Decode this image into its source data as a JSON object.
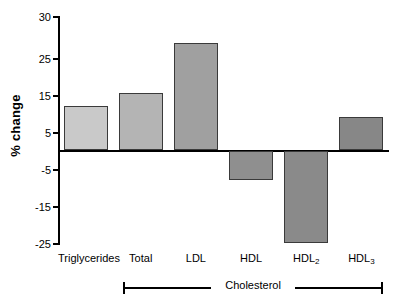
{
  "chart_data": {
    "type": "bar",
    "title": "",
    "xlabel": "",
    "ylabel": "% change",
    "categories": [
      "Triglycerides",
      "Total",
      "LDL",
      "HDL",
      "HDL₂",
      "HDL₃"
    ],
    "category_labels_html": [
      "Triglycerides",
      "Total",
      "LDL",
      "HDL",
      "HDL<sub>2</sub>",
      "HDL<sub>3</sub>"
    ],
    "values": [
      12,
      15.5,
      29,
      -8,
      -25,
      9
    ],
    "ylim": [
      -25,
      30
    ],
    "yticks": [
      30,
      25,
      15,
      5,
      -5,
      -15,
      -25
    ],
    "ytick_labels": [
      "30",
      "25",
      "15",
      "5",
      "-5",
      "-15",
      "-25"
    ],
    "grid": false,
    "legend": null,
    "bar_colors": [
      "#c9c9c9",
      "#b4b4b4",
      "#a0a0a0",
      "#8f8f8f",
      "#8a8a8a",
      "#878787"
    ],
    "bar_edge_color": "#3a3a3a",
    "axis_color": "#000000",
    "background_color": "#ffffff",
    "annotations": [
      {
        "name": "group-bracket",
        "label": "Cholesterol",
        "spans_categories": [
          "Total",
          "HDL₃"
        ]
      }
    ]
  },
  "axis": {
    "y_title": "% change"
  },
  "group": {
    "label": "Cholesterol"
  }
}
